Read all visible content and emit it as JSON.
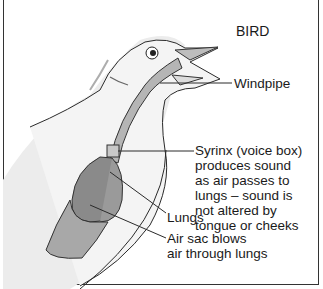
{
  "diagram": {
    "title": "BIRD",
    "labels": {
      "windpipe": "Windpipe",
      "syrinx": "Syrinx (voice box)\nproduces sound\nas air passes to\nlungs – sound is\nnot altered by\ntongue or cheeks",
      "lungs": "Lungs",
      "air_sac": "Air sac blows\nair through lungs"
    },
    "colors": {
      "organ_dark": "#8a8a8a",
      "organ_light": "#a8a8a8",
      "windpipe": "#b5b5b5",
      "body": "#f2f2f2",
      "line": "#2a2a2a"
    }
  }
}
